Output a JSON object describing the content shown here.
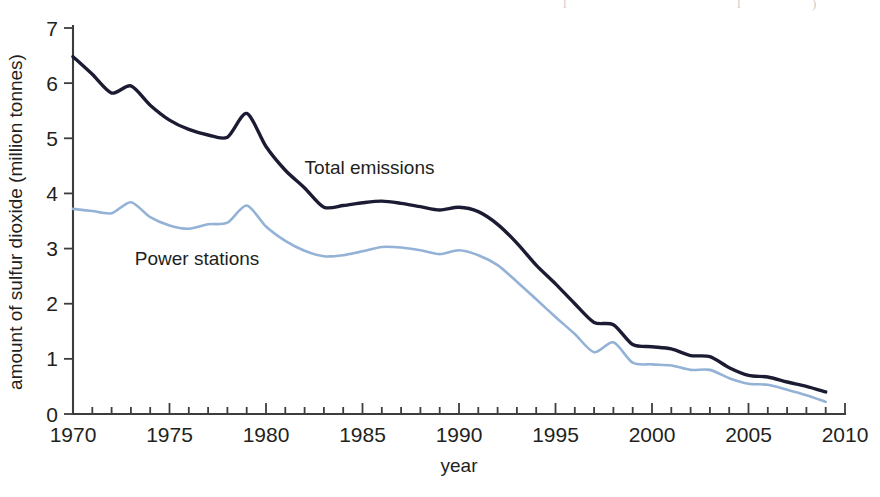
{
  "figure": {
    "background_color": "#ffffff",
    "top_scan_fragments": [
      {
        "text": "l",
        "x": 563
      },
      {
        "text": "l",
        "x": 737
      },
      {
        "text": ")",
        "x": 812
      }
    ]
  },
  "chart_data": {
    "type": "line",
    "title": "",
    "xlabel": "year",
    "ylabel": "amount of sulfur dioxide (million tonnes)",
    "xlim": [
      1970,
      2010
    ],
    "ylim": [
      0,
      7
    ],
    "grid": false,
    "legend_position": "inline-annotations",
    "x_major_ticks": [
      1970,
      1975,
      1980,
      1985,
      1990,
      1995,
      2000,
      2005,
      2010
    ],
    "x_major_tick_labels": [
      "1970",
      "1975",
      "1980",
      "1985",
      "1990",
      "1995",
      "2000",
      "2005",
      "2010"
    ],
    "x_minor_tick_step": 1,
    "y_ticks": [
      0,
      1,
      2,
      3,
      4,
      5,
      6,
      7
    ],
    "y_tick_labels": [
      "0",
      "1",
      "2",
      "3",
      "4",
      "5",
      "6",
      "7"
    ],
    "x": [
      1970,
      1971,
      1972,
      1973,
      1974,
      1975,
      1976,
      1977,
      1978,
      1979,
      1980,
      1981,
      1982,
      1983,
      1984,
      1985,
      1986,
      1987,
      1988,
      1989,
      1990,
      1991,
      1992,
      1993,
      1994,
      1995,
      1996,
      1997,
      1998,
      1999,
      2000,
      2001,
      2002,
      2003,
      2004,
      2005,
      2006,
      2007,
      2008,
      2009
    ],
    "series": [
      {
        "name": "Total emissions",
        "color": "#1b1b33",
        "line_width": 3.4,
        "label_x": 1982.0,
        "label_y": 4.35,
        "values": [
          6.48,
          6.16,
          5.82,
          5.95,
          5.6,
          5.33,
          5.16,
          5.06,
          5.02,
          5.45,
          4.85,
          4.42,
          4.1,
          3.75,
          3.78,
          3.83,
          3.86,
          3.82,
          3.76,
          3.7,
          3.75,
          3.67,
          3.44,
          3.1,
          2.7,
          2.36,
          2.0,
          1.66,
          1.62,
          1.26,
          1.22,
          1.18,
          1.06,
          1.04,
          0.84,
          0.7,
          0.67,
          0.58,
          0.5,
          0.4
        ]
      },
      {
        "name": "Power stations",
        "color": "#93b2d6",
        "line_width": 2.6,
        "label_x": 1973.2,
        "label_y": 2.7,
        "values": [
          3.72,
          3.68,
          3.64,
          3.84,
          3.57,
          3.42,
          3.36,
          3.44,
          3.47,
          3.78,
          3.4,
          3.14,
          2.96,
          2.86,
          2.88,
          2.95,
          3.03,
          3.02,
          2.97,
          2.9,
          2.97,
          2.88,
          2.7,
          2.4,
          2.08,
          1.76,
          1.45,
          1.12,
          1.3,
          0.93,
          0.9,
          0.88,
          0.8,
          0.8,
          0.65,
          0.55,
          0.53,
          0.44,
          0.34,
          0.22
        ]
      }
    ]
  }
}
